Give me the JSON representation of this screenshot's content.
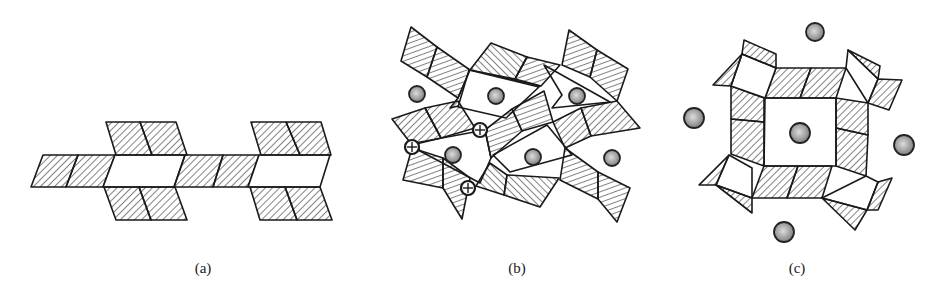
{
  "figure": {
    "panels": [
      {
        "id": "a",
        "label": "(a)",
        "description": "Infinite double chain of linked hatched tetrahedra/octahedra with open rings"
      },
      {
        "id": "b",
        "label": "(b)",
        "description": "Framework of rotated hatched polyhedra with large cations (grey spheres) in cavities and crossed-circle atoms at shared corners"
      },
      {
        "id": "c",
        "label": "(c)",
        "description": "Square ring of hatched polyhedra around a central cavity containing a cation, with additional cations outside"
      }
    ],
    "legend": {
      "hatched_polyhedron": "hatched-polyhedron",
      "cation": "grey-sphere",
      "shared_atom": "crossed-circle"
    },
    "colors": {
      "line": "#1a1a1a",
      "cation_fill_center": "#d8d8d8",
      "cation_fill_edge": "#7a7a7a",
      "background": "#ffffff"
    }
  }
}
